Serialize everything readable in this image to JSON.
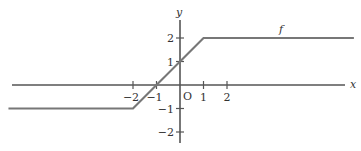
{
  "chart_data": {
    "type": "line",
    "title": "",
    "xlabel": "x",
    "ylabel": "y",
    "series": [
      {
        "name": "f",
        "x": [
          -7.3,
          -2,
          1,
          7.4
        ],
        "y": [
          -1,
          -1,
          2,
          2
        ]
      }
    ],
    "x_ticks": [
      -2,
      -1,
      1,
      2
    ],
    "x_tick_labels": [
      "−2",
      "−1",
      "1",
      "2"
    ],
    "y_ticks": [
      2,
      1,
      -1,
      -2
    ],
    "y_tick_labels": [
      "2",
      "1",
      "−1",
      "−2"
    ],
    "origin_label": "O",
    "curve_label": "f",
    "xlim": [
      -7.8,
      7.4
    ],
    "ylim": [
      -2.8,
      3.6
    ],
    "grid": false,
    "legend": "none",
    "colors": {
      "axis": "#555555",
      "curve": "#777777",
      "text": "#333333"
    }
  }
}
